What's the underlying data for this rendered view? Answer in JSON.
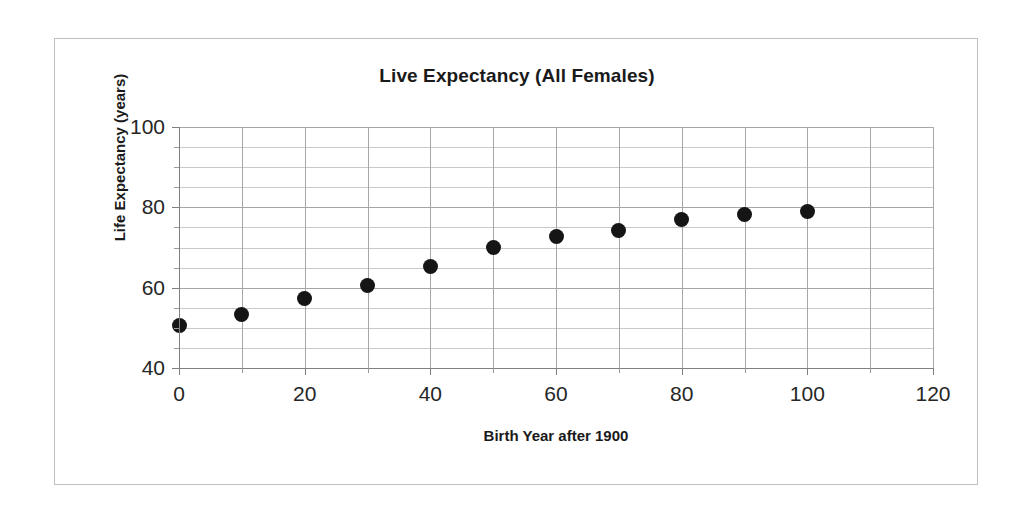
{
  "chart_data": {
    "type": "scatter",
    "title": "Live Expectancy (All Females)",
    "xlabel": "Birth Year after 1900",
    "ylabel": "Life Expectancy (years)",
    "xlim": [
      0,
      120
    ],
    "ylim": [
      40,
      100
    ],
    "x_major_ticks": [
      0,
      20,
      40,
      60,
      80,
      100,
      120
    ],
    "x_minor_ticks": [
      10,
      30,
      50,
      70,
      90,
      110
    ],
    "y_major_ticks": [
      40,
      60,
      80,
      100
    ],
    "y_minor_ticks": [
      45,
      50,
      55,
      65,
      70,
      75,
      85,
      90,
      95
    ],
    "x_tick_labels": [
      "0",
      "20",
      "40",
      "60",
      "80",
      "100",
      "120"
    ],
    "y_tick_labels": [
      "100",
      "80",
      "60",
      "40"
    ],
    "grid": {
      "horizontal": true,
      "vertical": true,
      "minor_horizontal": true,
      "major_color": "#a6a6a6",
      "minor_color": "#c8c8c8"
    },
    "legend": null,
    "marker": {
      "shape": "circle",
      "color": "#151515",
      "size_px": 15
    },
    "x": [
      0,
      10,
      20,
      30,
      40,
      50,
      60,
      70,
      80,
      90,
      100
    ],
    "values": [
      50.7,
      53.2,
      57.2,
      60.6,
      65.2,
      70.1,
      72.8,
      74.2,
      76.9,
      78.1,
      78.9
    ],
    "points": [
      {
        "x": 0,
        "y": 50.7
      },
      {
        "x": 10,
        "y": 53.2
      },
      {
        "x": 20,
        "y": 57.2
      },
      {
        "x": 30,
        "y": 60.6
      },
      {
        "x": 40,
        "y": 65.2
      },
      {
        "x": 50,
        "y": 70.1
      },
      {
        "x": 60,
        "y": 72.8
      },
      {
        "x": 70,
        "y": 74.2
      },
      {
        "x": 80,
        "y": 76.9
      },
      {
        "x": 90,
        "y": 78.1
      },
      {
        "x": 100,
        "y": 78.9
      }
    ]
  },
  "frame": {
    "border_color": "#bfbfbf",
    "background": "#ffffff"
  }
}
